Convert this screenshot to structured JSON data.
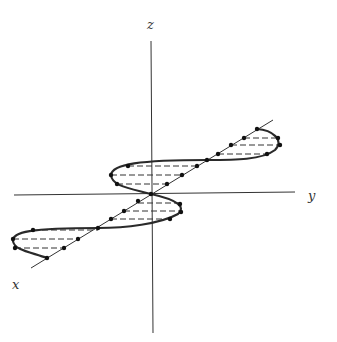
{
  "diagram": {
    "colors": {
      "line": "#333333",
      "curve": "#2a2a2a",
      "dots": "#111111",
      "background": "#ffffff"
    },
    "axes": {
      "z": {
        "label": "z",
        "x1": 151,
        "y1": 41,
        "x2": 153,
        "y2": 333,
        "label_x": 147,
        "label_y": 29
      },
      "y": {
        "label": "y",
        "x1": 14,
        "y1": 195,
        "x2": 295,
        "y2": 192,
        "label_x": 308,
        "label_y": 200
      },
      "x": {
        "label": "x",
        "x1": 31,
        "y1": 268,
        "x2": 273,
        "y2": 120,
        "label_x": 12,
        "label_y": 289
      }
    },
    "curve_path": "M 31 268 M 47 258 C 30 252, 14 250, 13 241 C 12 232, 30 228, 98 228 C 125 228, 160 224, 178 214 C 186 207, 178 200, 151 194 C 128 188, 112 186, 111 175 C 112 164, 140 160, 207 160 C 235 160, 262 160, 275 150 C 285 140, 272 130, 257 129",
    "dashes": [
      {
        "x1": 257,
        "y1": 129,
        "x2": 257,
        "y2": 129
      },
      {
        "x1": 244,
        "y1": 138,
        "x2": 278,
        "y2": 138
      },
      {
        "x1": 231,
        "y1": 145,
        "x2": 280,
        "y2": 145
      },
      {
        "x1": 218,
        "y1": 154,
        "x2": 267,
        "y2": 154
      },
      {
        "x1": 128,
        "y1": 166,
        "x2": 197,
        "y2": 166
      },
      {
        "x1": 111,
        "y1": 175,
        "x2": 182,
        "y2": 175
      },
      {
        "x1": 117,
        "y1": 184,
        "x2": 167,
        "y2": 184
      },
      {
        "x1": 138,
        "y1": 203,
        "x2": 180,
        "y2": 203
      },
      {
        "x1": 124,
        "y1": 211,
        "x2": 181,
        "y2": 211
      },
      {
        "x1": 111,
        "y1": 219,
        "x2": 170,
        "y2": 219
      },
      {
        "x1": 33,
        "y1": 230,
        "x2": 98,
        "y2": 230
      },
      {
        "x1": 13,
        "y1": 239,
        "x2": 78,
        "y2": 239
      },
      {
        "x1": 15,
        "y1": 248,
        "x2": 64,
        "y2": 248
      }
    ],
    "dots": [
      {
        "x": 257,
        "y": 129
      },
      {
        "x": 278,
        "y": 138
      },
      {
        "x": 280,
        "y": 145
      },
      {
        "x": 267,
        "y": 154
      },
      {
        "x": 244,
        "y": 138
      },
      {
        "x": 231,
        "y": 145
      },
      {
        "x": 218,
        "y": 154
      },
      {
        "x": 207,
        "y": 160
      },
      {
        "x": 128,
        "y": 166
      },
      {
        "x": 111,
        "y": 175
      },
      {
        "x": 117,
        "y": 184
      },
      {
        "x": 197,
        "y": 166
      },
      {
        "x": 182,
        "y": 175
      },
      {
        "x": 167,
        "y": 184
      },
      {
        "x": 151,
        "y": 194
      },
      {
        "x": 180,
        "y": 204
      },
      {
        "x": 181,
        "y": 212
      },
      {
        "x": 170,
        "y": 219
      },
      {
        "x": 138,
        "y": 201
      },
      {
        "x": 124,
        "y": 211
      },
      {
        "x": 111,
        "y": 219
      },
      {
        "x": 98,
        "y": 228
      },
      {
        "x": 33,
        "y": 230
      },
      {
        "x": 13,
        "y": 239
      },
      {
        "x": 15,
        "y": 248
      },
      {
        "x": 47,
        "y": 258
      },
      {
        "x": 78,
        "y": 239
      },
      {
        "x": 64,
        "y": 248
      }
    ]
  }
}
